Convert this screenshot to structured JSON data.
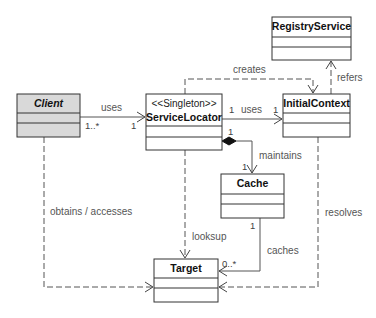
{
  "diagram": {
    "type": "UML class diagram",
    "pattern": "Service Locator",
    "classes": {
      "client": {
        "name": "Client",
        "stereotype": null,
        "abstract": true,
        "x": 17,
        "y": 94,
        "w": 63,
        "nameH": 19,
        "attrH": 10,
        "opsH": 14
      },
      "serviceLocator": {
        "name": "ServiceLocator",
        "stereotype": "<<Singleton>>",
        "abstract": false,
        "x": 146,
        "y": 94,
        "w": 76,
        "nameH": 32,
        "attrH": 11,
        "opsH": 13
      },
      "initialContext": {
        "name": "InitialContext",
        "stereotype": null,
        "abstract": false,
        "x": 283,
        "y": 94,
        "w": 67,
        "nameH": 19,
        "attrH": 10,
        "opsH": 14
      },
      "registryService": {
        "name": "RegistryService",
        "stereotype": null,
        "abstract": false,
        "x": 272,
        "y": 17,
        "w": 79,
        "nameH": 20,
        "attrH": 10,
        "opsH": 13
      },
      "cache": {
        "name": "Cache",
        "stereotype": null,
        "abstract": false,
        "x": 221,
        "y": 174,
        "w": 63,
        "nameH": 20,
        "attrH": 10,
        "opsH": 14
      },
      "target": {
        "name": "Target",
        "stereotype": null,
        "abstract": false,
        "x": 154,
        "y": 259,
        "w": 64,
        "nameH": 19,
        "attrH": 10,
        "opsH": 14
      }
    },
    "relationships": {
      "clientUsesLocator": {
        "label": "uses",
        "from": "Client",
        "to": "ServiceLocator",
        "kind": "association",
        "sourceMult": "1..*",
        "targetMult": "1"
      },
      "locatorUsesContext": {
        "label": "uses",
        "from": "ServiceLocator",
        "to": "InitialContext",
        "kind": "association",
        "sourceMult": "1",
        "targetMult": "1"
      },
      "locatorCreatesContext": {
        "label": "creates",
        "from": "ServiceLocator",
        "to": "InitialContext",
        "kind": "dependency"
      },
      "contextRefersRegistry": {
        "label": "refers",
        "from": "InitialContext",
        "to": "RegistryService",
        "kind": "dependency"
      },
      "locatorMaintainsCache": {
        "label": "maintains",
        "from": "ServiceLocator",
        "to": "Cache",
        "kind": "composition",
        "sourceMult": "1",
        "targetMult": "1"
      },
      "locatorLooksupTarget": {
        "label": "looksup",
        "from": "ServiceLocator",
        "to": "Target",
        "kind": "dependency"
      },
      "cacheCachesTarget": {
        "label": "caches",
        "from": "Cache",
        "to": "Target",
        "kind": "association",
        "sourceMult": "1",
        "targetMult": "0..*"
      },
      "clientObtainsTarget": {
        "label": "obtains / accesses",
        "from": "Client",
        "to": "Target",
        "kind": "dependency"
      },
      "contextResolvesTarget": {
        "label": "resolves",
        "from": "InitialContext",
        "to": "Target",
        "kind": "dependency"
      }
    },
    "colors": {
      "abstract_fill": "#d9d9d9",
      "box_fill": "#ffffff",
      "line": "#555555",
      "label": "#555555"
    }
  }
}
